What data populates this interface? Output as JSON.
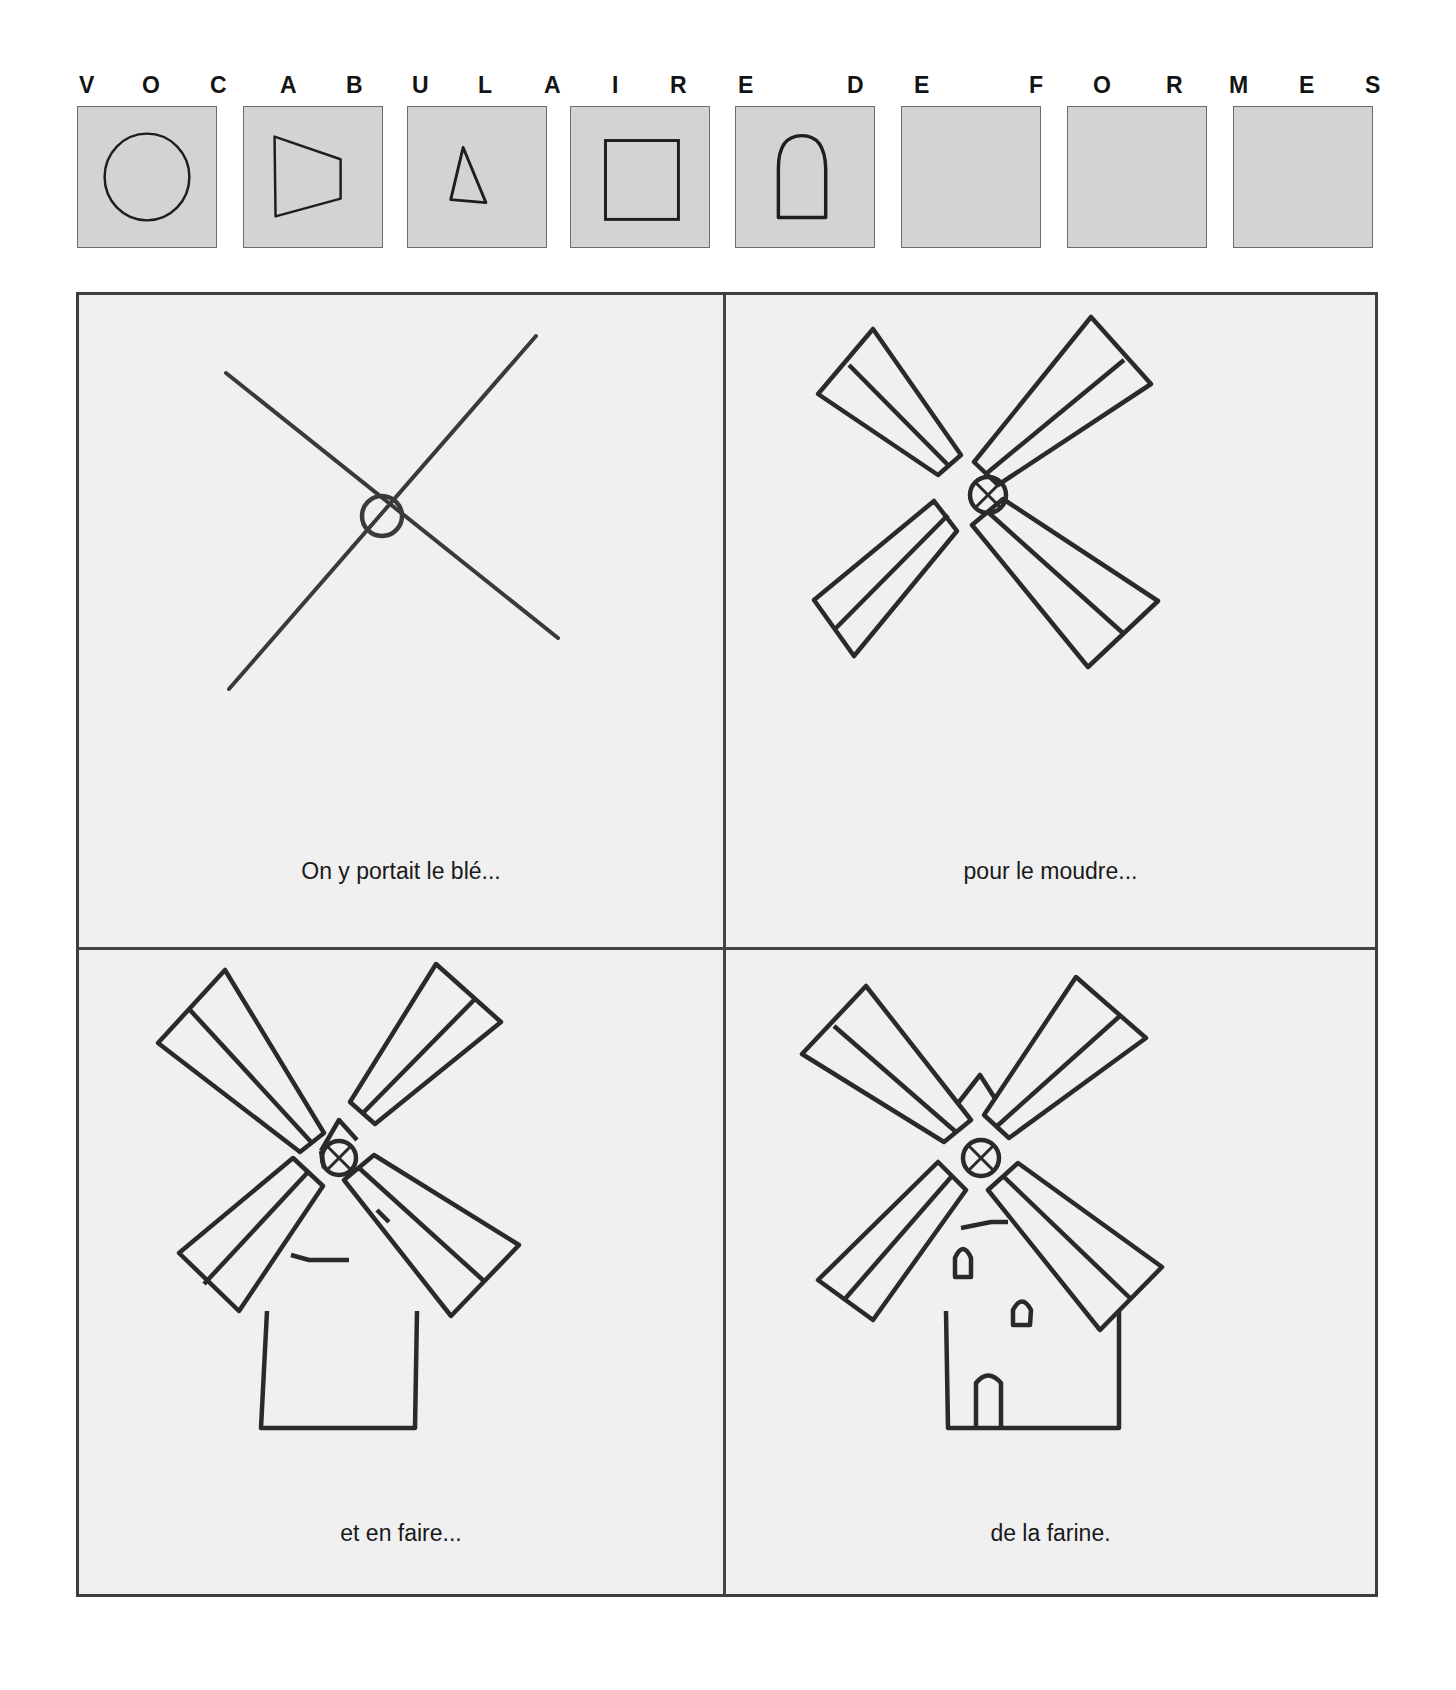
{
  "header": {
    "letters": [
      {
        "ch": "V",
        "x": 79
      },
      {
        "ch": "O",
        "x": 142
      },
      {
        "ch": "C",
        "x": 210
      },
      {
        "ch": "A",
        "x": 280
      },
      {
        "ch": "B",
        "x": 346
      },
      {
        "ch": "U",
        "x": 412
      },
      {
        "ch": "L",
        "x": 478
      },
      {
        "ch": "A",
        "x": 544
      },
      {
        "ch": "I",
        "x": 612
      },
      {
        "ch": "R",
        "x": 670
      },
      {
        "ch": "E",
        "x": 738
      },
      {
        "ch": "D",
        "x": 847
      },
      {
        "ch": "E",
        "x": 914
      },
      {
        "ch": "F",
        "x": 1029
      },
      {
        "ch": "O",
        "x": 1093
      },
      {
        "ch": "R",
        "x": 1166
      },
      {
        "ch": "M",
        "x": 1229
      },
      {
        "ch": "E",
        "x": 1299
      },
      {
        "ch": "S",
        "x": 1365
      }
    ]
  },
  "shape_vocabulary": {
    "tiles": [
      {
        "shape": "circle",
        "x": 77
      },
      {
        "shape": "trapezoid",
        "x": 243
      },
      {
        "shape": "triangle",
        "x": 407
      },
      {
        "shape": "square",
        "x": 570
      },
      {
        "shape": "arch",
        "x": 735
      },
      {
        "shape": "empty",
        "x": 901
      },
      {
        "shape": "empty",
        "x": 1067
      },
      {
        "shape": "empty",
        "x": 1233
      }
    ],
    "tile_fill": "#d3d3d3"
  },
  "steps": [
    {
      "step": 1,
      "caption": "On y portait le blé...",
      "drawing": "cross-with-hub"
    },
    {
      "step": 2,
      "caption": "pour le moudre...",
      "drawing": "four-sails"
    },
    {
      "step": 3,
      "caption": "et en faire...",
      "drawing": "sails-with-cap-and-tower"
    },
    {
      "step": 4,
      "caption": "de la farine.",
      "drawing": "complete-windmill-with-windows-and-door"
    }
  ],
  "colors": {
    "panel_bg": "#f0f0f0",
    "stroke": "#2a2a2a",
    "frame": "#3e3e3e"
  }
}
